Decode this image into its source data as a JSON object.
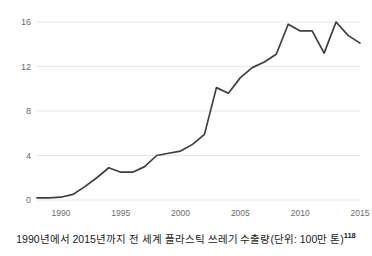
{
  "caption": {
    "text": "1990년에서 2015년까지 전 세계 플라스틱 쓰레기 수출량(단위: 100만 톤)",
    "footnote": "118"
  },
  "colors": {
    "line": "#3f3f3f",
    "grid": "#e8e8e8",
    "axis_text": "#6b6b6b",
    "background": "#ffffff",
    "caption_text": "#1a1a1a"
  },
  "chart_data": {
    "type": "line",
    "title": "",
    "subtitle": "",
    "xlabel": "",
    "ylabel": "",
    "xlim": [
      1988,
      2015
    ],
    "ylim": [
      0,
      16
    ],
    "grid": true,
    "legend": false,
    "legend_position": "none",
    "yticks": [
      0,
      4,
      8,
      12,
      16
    ],
    "ytick_labels": [
      "0",
      "4",
      "8",
      "12",
      "16"
    ],
    "xticks": [
      1990,
      1995,
      2000,
      2005,
      2010,
      2015
    ],
    "xtick_labels": [
      "1990",
      "1995",
      "2000",
      "2005",
      "2010",
      "2015"
    ],
    "x": [
      1988,
      1989,
      1990,
      1991,
      1992,
      1993,
      1994,
      1995,
      1996,
      1997,
      1998,
      1999,
      2000,
      2001,
      2002,
      2003,
      2004,
      2005,
      2006,
      2007,
      2008,
      2009,
      2010,
      2011,
      2012,
      2013,
      2014,
      2015
    ],
    "series": [
      {
        "name": "전 세계 플라스틱 쓰레기 수출량",
        "values": [
          0.2,
          0.2,
          0.25,
          0.5,
          1.2,
          2.0,
          2.9,
          2.5,
          2.5,
          3.0,
          4.0,
          4.2,
          4.4,
          5.0,
          5.9,
          10.1,
          9.6,
          11.0,
          11.9,
          12.4,
          13.1,
          15.8,
          15.2,
          15.2,
          13.2,
          16.0,
          14.8,
          14.1
        ]
      }
    ]
  }
}
